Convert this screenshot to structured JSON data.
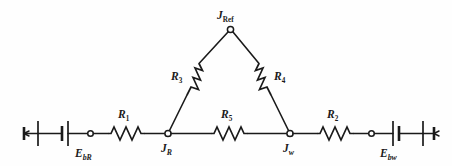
{
  "figure": {
    "kind": "electrical-circuit-diagram",
    "background_color": "#fefefe",
    "line_color": "#1a1a1a"
  },
  "labels": {
    "junction_ref": {
      "base": "J",
      "sub": "Ref",
      "full": "J_Ref"
    },
    "junction_r": {
      "base": "J",
      "sub": "R",
      "full": "J_R"
    },
    "junction_w": {
      "base": "J",
      "sub": "w",
      "full": "J_w"
    },
    "resistor_1": {
      "base": "R",
      "sub": "1",
      "full": "R_1"
    },
    "resistor_2": {
      "base": "R",
      "sub": "2",
      "full": "R_2"
    },
    "resistor_3": {
      "base": "R",
      "sub": "3",
      "full": "R_3"
    },
    "resistor_4": {
      "base": "R",
      "sub": "4",
      "full": "R_4"
    },
    "resistor_5": {
      "base": "R",
      "sub": "5",
      "full": "R_5"
    },
    "battery_left": {
      "base": "E",
      "sub": "bR",
      "full": "E_bR"
    },
    "battery_right": {
      "base": "E",
      "sub": "bw",
      "full": "E_bw"
    }
  },
  "components": [
    {
      "id": "battery-left",
      "type": "battery",
      "label": "E_bR"
    },
    {
      "id": "battery-right",
      "type": "battery",
      "label": "E_bw"
    },
    {
      "id": "resistor-r1",
      "type": "resistor",
      "label": "R_1"
    },
    {
      "id": "resistor-r2",
      "type": "resistor",
      "label": "R_2"
    },
    {
      "id": "resistor-r3",
      "type": "resistor",
      "label": "R_3"
    },
    {
      "id": "resistor-r4",
      "type": "resistor",
      "label": "R_4"
    },
    {
      "id": "resistor-r5",
      "type": "resistor",
      "label": "R_5"
    },
    {
      "id": "junction-jref",
      "type": "node",
      "label": "J_Ref"
    },
    {
      "id": "junction-jr",
      "type": "node",
      "label": "J_R"
    },
    {
      "id": "junction-jw",
      "type": "node",
      "label": "J_w"
    },
    {
      "id": "terminal-left",
      "type": "terminal",
      "label": ""
    },
    {
      "id": "terminal-right",
      "type": "terminal",
      "label": ""
    }
  ]
}
